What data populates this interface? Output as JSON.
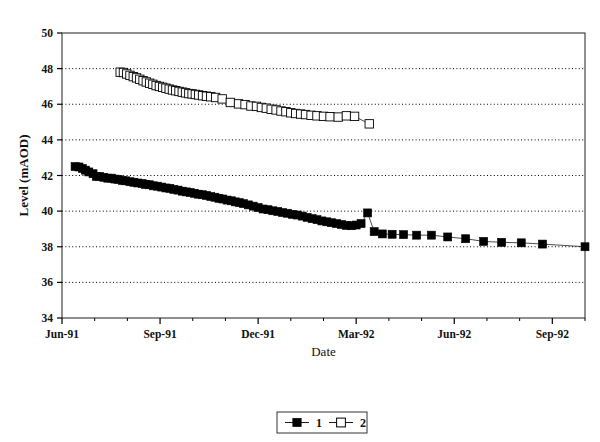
{
  "chart_data": {
    "type": "scatter",
    "title": "",
    "xlabel": "Date",
    "ylabel": "Level (mAOD)",
    "ylim": [
      34,
      50
    ],
    "ytick_step": 2,
    "yticks": [
      34,
      36,
      38,
      40,
      42,
      44,
      46,
      48,
      50
    ],
    "ytick_labels": [
      "34",
      "36",
      "38",
      "40",
      "42",
      "44",
      "46",
      "48",
      "50"
    ],
    "xlim_months": [
      0,
      16
    ],
    "x_axis_start": "Jun-91",
    "xtick_labels": [
      "Jun-91",
      "Sep-91",
      "Dec-91",
      "Mar-92",
      "Jun-92",
      "Sep-92"
    ],
    "xtick_months": [
      0,
      3,
      6,
      9,
      12,
      15
    ],
    "minor_xticks_per_major": 3,
    "grid": "horizontal-dotted",
    "legend_position": "below-plot-center",
    "marker_line_color": "#000000",
    "series": [
      {
        "name": "1",
        "legend_label": "1",
        "marker": "filled-square",
        "marker_fill": "#000000",
        "points": [
          [
            0.4,
            42.5
          ],
          [
            0.52,
            42.48
          ],
          [
            0.62,
            42.4
          ],
          [
            0.72,
            42.3
          ],
          [
            0.82,
            42.2
          ],
          [
            0.95,
            42.1
          ],
          [
            1.05,
            41.95
          ],
          [
            1.15,
            41.95
          ],
          [
            1.28,
            41.9
          ],
          [
            1.4,
            41.85
          ],
          [
            1.52,
            41.85
          ],
          [
            1.62,
            41.8
          ],
          [
            1.72,
            41.78
          ],
          [
            1.85,
            41.72
          ],
          [
            1.95,
            41.7
          ],
          [
            2.08,
            41.65
          ],
          [
            2.2,
            41.62
          ],
          [
            2.32,
            41.58
          ],
          [
            2.45,
            41.55
          ],
          [
            2.55,
            41.5
          ],
          [
            2.68,
            41.48
          ],
          [
            2.8,
            41.42
          ],
          [
            2.92,
            41.4
          ],
          [
            3.05,
            41.35
          ],
          [
            3.18,
            41.3
          ],
          [
            3.3,
            41.28
          ],
          [
            3.42,
            41.22
          ],
          [
            3.55,
            41.18
          ],
          [
            3.68,
            41.12
          ],
          [
            3.8,
            41.08
          ],
          [
            3.92,
            41.05
          ],
          [
            4.05,
            41.0
          ],
          [
            4.18,
            40.95
          ],
          [
            4.3,
            40.92
          ],
          [
            4.42,
            40.88
          ],
          [
            4.55,
            40.82
          ],
          [
            4.68,
            40.78
          ],
          [
            4.8,
            40.72
          ],
          [
            4.92,
            40.68
          ],
          [
            5.05,
            40.62
          ],
          [
            5.18,
            40.58
          ],
          [
            5.3,
            40.52
          ],
          [
            5.42,
            40.48
          ],
          [
            5.55,
            40.42
          ],
          [
            5.7,
            40.35
          ],
          [
            5.85,
            40.28
          ],
          [
            6.0,
            40.2
          ],
          [
            6.15,
            40.12
          ],
          [
            6.3,
            40.08
          ],
          [
            6.45,
            40.02
          ],
          [
            6.6,
            39.98
          ],
          [
            6.75,
            39.92
          ],
          [
            6.9,
            39.88
          ],
          [
            7.05,
            39.82
          ],
          [
            7.2,
            39.78
          ],
          [
            7.35,
            39.72
          ],
          [
            7.5,
            39.65
          ],
          [
            7.65,
            39.58
          ],
          [
            7.8,
            39.52
          ],
          [
            7.95,
            39.45
          ],
          [
            8.1,
            39.4
          ],
          [
            8.25,
            39.35
          ],
          [
            8.4,
            39.3
          ],
          [
            8.55,
            39.25
          ],
          [
            8.7,
            39.2
          ],
          [
            8.85,
            39.18
          ],
          [
            9.0,
            39.22
          ],
          [
            9.15,
            39.3
          ],
          [
            9.35,
            39.9
          ],
          [
            9.55,
            38.85
          ],
          [
            9.8,
            38.72
          ],
          [
            10.1,
            38.7
          ],
          [
            10.45,
            38.68
          ],
          [
            10.85,
            38.65
          ],
          [
            11.3,
            38.65
          ],
          [
            11.8,
            38.55
          ],
          [
            12.35,
            38.45
          ],
          [
            12.9,
            38.3
          ],
          [
            13.45,
            38.25
          ],
          [
            14.05,
            38.22
          ],
          [
            14.7,
            38.15
          ],
          [
            16.0,
            38.0
          ]
        ]
      },
      {
        "name": "2",
        "legend_label": "2",
        "marker": "open-square",
        "marker_fill": "#ffffff",
        "points": [
          [
            1.78,
            47.8
          ],
          [
            1.88,
            47.78
          ],
          [
            1.98,
            47.7
          ],
          [
            2.08,
            47.62
          ],
          [
            2.18,
            47.55
          ],
          [
            2.28,
            47.48
          ],
          [
            2.38,
            47.4
          ],
          [
            2.48,
            47.32
          ],
          [
            2.58,
            47.25
          ],
          [
            2.68,
            47.18
          ],
          [
            2.78,
            47.12
          ],
          [
            2.88,
            47.05
          ],
          [
            2.98,
            47.0
          ],
          [
            3.08,
            46.95
          ],
          [
            3.18,
            46.9
          ],
          [
            3.28,
            46.85
          ],
          [
            3.38,
            46.8
          ],
          [
            3.48,
            46.76
          ],
          [
            3.58,
            46.72
          ],
          [
            3.68,
            46.68
          ],
          [
            3.78,
            46.64
          ],
          [
            3.88,
            46.6
          ],
          [
            3.98,
            46.58
          ],
          [
            4.08,
            46.55
          ],
          [
            4.18,
            46.52
          ],
          [
            4.3,
            46.48
          ],
          [
            4.42,
            46.45
          ],
          [
            4.55,
            46.42
          ],
          [
            4.7,
            46.38
          ],
          [
            4.9,
            46.3
          ],
          [
            5.15,
            46.1
          ],
          [
            5.4,
            46.02
          ],
          [
            5.6,
            45.98
          ],
          [
            5.78,
            45.9
          ],
          [
            5.95,
            45.88
          ],
          [
            6.1,
            45.82
          ],
          [
            6.25,
            45.78
          ],
          [
            6.4,
            45.72
          ],
          [
            6.55,
            45.68
          ],
          [
            6.7,
            45.62
          ],
          [
            6.85,
            45.58
          ],
          [
            7.0,
            45.52
          ],
          [
            7.15,
            45.48
          ],
          [
            7.3,
            45.45
          ],
          [
            7.45,
            45.42
          ],
          [
            7.62,
            45.38
          ],
          [
            7.8,
            45.35
          ],
          [
            8.0,
            45.32
          ],
          [
            8.2,
            45.3
          ],
          [
            8.45,
            45.28
          ],
          [
            8.7,
            45.35
          ],
          [
            8.95,
            45.32
          ],
          [
            9.4,
            44.9
          ]
        ]
      }
    ]
  },
  "legend": {
    "entries": [
      {
        "label": "1",
        "marker": "filled-square"
      },
      {
        "label": "2",
        "marker": "open-square"
      }
    ]
  }
}
